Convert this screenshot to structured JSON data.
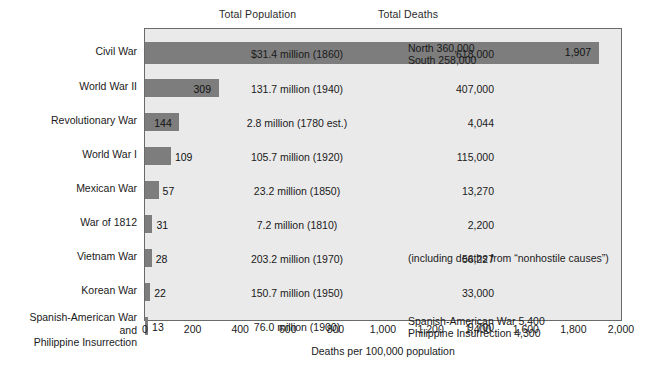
{
  "headers": {
    "population": "Total Population",
    "deaths": "Total Deaths"
  },
  "axis": {
    "title": "Deaths per 100,000 population",
    "ticks": [
      "0",
      "200",
      "400",
      "600",
      "800",
      "1,000",
      "1,200",
      "1,400",
      "1,600",
      "1,800",
      "2,000"
    ],
    "min": 0,
    "max": 2000
  },
  "colors": {
    "bar": "#7d7d7d",
    "plot_background": "#eaeaea",
    "plot_border": "#6a6a6a",
    "page_background": "#ffffff",
    "text": "#1a1a1a"
  },
  "chart_data": {
    "type": "bar",
    "title": "",
    "subtitle": "",
    "xlabel": "Deaths per 100,000 population",
    "ylabel": "",
    "xlim": [
      0,
      2000
    ],
    "grid": false,
    "legend": "none",
    "orientation": "horizontal",
    "categories": [
      "Civil War",
      "World War II",
      "Revolutionary War",
      "World War I",
      "Mexican War",
      "War of 1812",
      "Vietnam War",
      "Korean War",
      "Spanish-American War\nand\nPhilippine Insurrection"
    ],
    "values": [
      1907,
      309,
      144,
      109,
      57,
      31,
      28,
      22,
      13
    ],
    "value_labels": [
      "1,907",
      "309",
      "144",
      "109",
      "57",
      "31",
      "28",
      "22",
      "13"
    ],
    "total_population": [
      "$31.4 million (1860)",
      "131.7 million (1940)",
      "2.8 million (1780 est.)",
      "105.7 million (1920)",
      "23.2 million (1850)",
      "7.2 million (1810)",
      "203.2 million (1970)",
      "150.7 million (1950)",
      "76.0 million (1900)"
    ],
    "total_deaths": [
      "618,000",
      "407,000",
      "4,044",
      "115,000",
      "13,270",
      "2,200",
      "56,227",
      "33,000",
      "9,700"
    ],
    "notes": [
      "North 360,000\nSouth 258,000",
      "",
      "",
      "",
      "",
      "",
      "(including deaths from “nonhostile causes”)",
      "",
      "Spanish-American War 5,400\nPhilippine Insurrection 4,300"
    ]
  }
}
